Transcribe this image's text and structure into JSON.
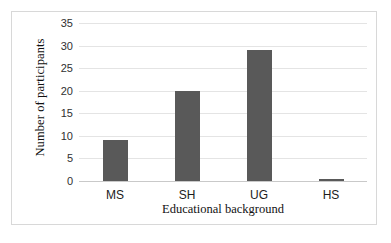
{
  "chart_data": {
    "type": "bar",
    "title": "",
    "categories": [
      "MS",
      "SH",
      "UG",
      "HS"
    ],
    "values": [
      9,
      20,
      29,
      0.5
    ],
    "xlabel": "Educational background",
    "ylabel": "Number of participants",
    "ylim": [
      0,
      35
    ],
    "ytick_labels": [
      "0",
      "5",
      "10",
      "15",
      "20",
      "25",
      "30",
      "35"
    ],
    "ytick_values": [
      0,
      5,
      10,
      15,
      20,
      25,
      30,
      35
    ],
    "grid": true,
    "legend": false,
    "bar_color": "#595959",
    "gridline_color": "#e4e4e4",
    "axis_color": "#c9c9c9",
    "frame_color": "#d8d8d8",
    "background": "#ffffff"
  }
}
